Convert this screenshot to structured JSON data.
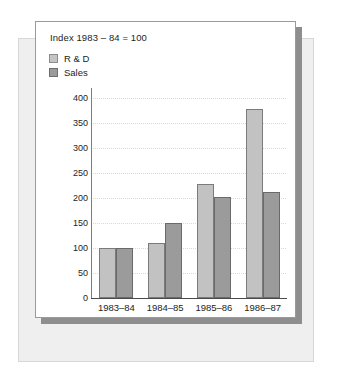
{
  "chart_data": {
    "type": "bar",
    "title": "Index 1983 – 84 = 100",
    "xlabel": "",
    "ylabel": "",
    "categories": [
      "1983–84",
      "1984–85",
      "1985–86",
      "1986–87"
    ],
    "series": [
      {
        "name": "R & D",
        "values": [
          100,
          110,
          228,
          378
        ],
        "color": "#c2c2c2"
      },
      {
        "name": "Sales",
        "values": [
          100,
          150,
          202,
          212
        ],
        "color": "#9b9b9b"
      }
    ],
    "ylim": [
      0,
      420
    ],
    "yticks": [
      0,
      50,
      100,
      150,
      200,
      250,
      300,
      350,
      400
    ],
    "ytick_labels": [
      "0",
      "50",
      "100",
      "150",
      "200",
      "250",
      "300",
      "350",
      "400"
    ],
    "grid": true,
    "grid_style": "dotted-horizontal",
    "legend_position": "top-left"
  },
  "legend": {
    "items": [
      {
        "label": "R & D",
        "swatch": "light-gray-square"
      },
      {
        "label": "Sales",
        "swatch": "dark-gray-square"
      }
    ]
  },
  "colors": {
    "card_background": "#ffffff",
    "back_sheet": "#efefef",
    "shadow_sheet": "#8e8e8e",
    "axis": "#4a4a4a",
    "gridline": "#d9d9d9",
    "text": "#1d1d1d"
  }
}
